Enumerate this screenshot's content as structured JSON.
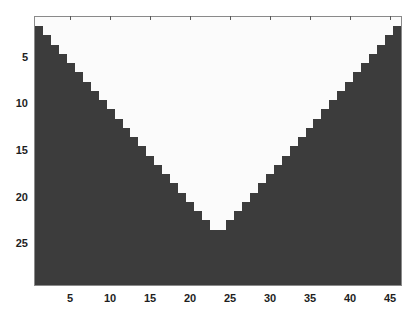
{
  "chart_data": {
    "type": "heatmap",
    "title": "",
    "xlabel": "",
    "ylabel": "",
    "rows": 29,
    "cols": 46,
    "x_range": [
      0.5,
      46.5
    ],
    "y_range": [
      0.5,
      29.5
    ],
    "y_reversed": true,
    "colormap": {
      "0": "#3c3c3c",
      "1": "#fbfbfb"
    },
    "rule": "value = 1 if row == 1 or (row <= 23 and row <= col <= 47 - row) else 0",
    "white_ranges_by_row": [
      [
        1,
        46
      ],
      [
        2,
        45
      ],
      [
        3,
        44
      ],
      [
        4,
        43
      ],
      [
        5,
        42
      ],
      [
        6,
        41
      ],
      [
        7,
        40
      ],
      [
        8,
        39
      ],
      [
        9,
        38
      ],
      [
        10,
        37
      ],
      [
        11,
        36
      ],
      [
        12,
        35
      ],
      [
        13,
        34
      ],
      [
        14,
        33
      ],
      [
        15,
        32
      ],
      [
        16,
        31
      ],
      [
        17,
        30
      ],
      [
        18,
        29
      ],
      [
        19,
        28
      ],
      [
        20,
        27
      ],
      [
        21,
        26
      ],
      [
        22,
        25
      ],
      [
        23,
        24
      ],
      null,
      null,
      null,
      null,
      null,
      null
    ],
    "xticks": [
      5,
      10,
      15,
      20,
      25,
      30,
      35,
      40,
      45
    ],
    "yticks": [
      5,
      10,
      15,
      20,
      25
    ],
    "grid": false,
    "legend": null
  },
  "xtick_labels": [
    "5",
    "10",
    "15",
    "20",
    "25",
    "30",
    "35",
    "40",
    "45"
  ],
  "ytick_labels": [
    "5",
    "10",
    "15",
    "20",
    "25"
  ],
  "colors": {
    "low": "#3c3c3c",
    "high": "#fbfbfb",
    "axis": "#8a8a8a",
    "text": "#1e1e1e"
  }
}
